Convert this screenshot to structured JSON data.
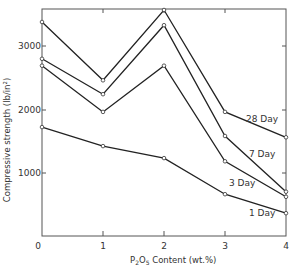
{
  "chart_data": {
    "type": "line",
    "title": "",
    "xlabel": "P2O5 Content (wt.%)",
    "ylabel": "Compressive strength (lb/in²)",
    "x": [
      0,
      1,
      2,
      3,
      4
    ],
    "xlim": [
      0,
      4
    ],
    "ylim": [
      0,
      3600
    ],
    "x_ticks": [
      "0",
      "1",
      "2",
      "3",
      "4"
    ],
    "y_ticks": [
      "1000",
      "2000",
      "3000"
    ],
    "grid": false,
    "legend": "inline labels at right end of each line",
    "series": [
      {
        "name": "28 Day",
        "values": [
          3380,
          2460,
          3570,
          1960,
          1560
        ]
      },
      {
        "name": "7 Day",
        "values": [
          2800,
          2240,
          3330,
          1580,
          700
        ]
      },
      {
        "name": "3 Day",
        "values": [
          2690,
          1960,
          2690,
          1180,
          620
        ]
      },
      {
        "name": "1 Day",
        "values": [
          1720,
          1420,
          1230,
          660,
          360
        ]
      }
    ]
  },
  "labels": {
    "x_zero": "0",
    "x_ticks": [
      "1",
      "2",
      "3",
      "4"
    ],
    "y_ticks": [
      "1000",
      "2000",
      "3000"
    ],
    "xlabel_main": "Content (wt.%)",
    "xlabel_p": "P",
    "xlabel_2": "2",
    "xlabel_o": "O",
    "xlabel_5": "5",
    "ylabel": "Compressive strength (lb/in²)",
    "series_labels": [
      "28 Day",
      "7 Day",
      "3 Day",
      "1 Day"
    ]
  }
}
